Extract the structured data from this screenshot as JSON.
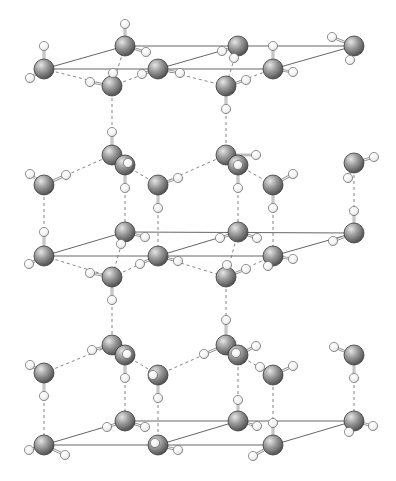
{
  "figure": {
    "caption_fragment": "... oxygen atoms ..."
  },
  "legend": {
    "oxygen_color": "#7a7a7a",
    "hydrogen_color": "#f4f4f4",
    "cell_line_color": "#555555",
    "hbond_line_color": "#777777"
  },
  "cells": [
    {
      "name": "top-cell",
      "pts": [
        [
          44,
          69
        ],
        [
          125,
          46
        ],
        [
          354,
          46
        ],
        [
          273,
          69
        ]
      ]
    },
    {
      "name": "middle-cell",
      "pts": [
        [
          44,
          256
        ],
        [
          125,
          232
        ],
        [
          354,
          233
        ],
        [
          273,
          256
        ]
      ]
    },
    {
      "name": "bottom-cell",
      "pts": [
        [
          44,
          445
        ],
        [
          125,
          421
        ],
        [
          354,
          421
        ],
        [
          273,
          445
        ]
      ]
    }
  ],
  "cell_edges": [
    [
      [
        44,
        69
      ],
      [
        158,
        69
      ]
    ],
    [
      [
        158,
        69
      ],
      [
        273,
        69
      ]
    ],
    [
      [
        125,
        46
      ],
      [
        238,
        46
      ]
    ],
    [
      [
        238,
        46
      ],
      [
        354,
        46
      ]
    ],
    [
      [
        44,
        69
      ],
      [
        125,
        46
      ]
    ],
    [
      [
        158,
        69
      ],
      [
        238,
        46
      ]
    ],
    [
      [
        273,
        69
      ],
      [
        354,
        46
      ]
    ],
    [
      [
        44,
        256
      ],
      [
        273,
        256
      ]
    ],
    [
      [
        125,
        232
      ],
      [
        354,
        233
      ]
    ],
    [
      [
        44,
        256
      ],
      [
        125,
        232
      ]
    ],
    [
      [
        158,
        256
      ],
      [
        238,
        232
      ]
    ],
    [
      [
        273,
        256
      ],
      [
        354,
        233
      ]
    ],
    [
      [
        44,
        445
      ],
      [
        273,
        445
      ]
    ],
    [
      [
        125,
        421
      ],
      [
        354,
        421
      ]
    ],
    [
      [
        44,
        445
      ],
      [
        125,
        421
      ]
    ],
    [
      [
        158,
        445
      ],
      [
        238,
        421
      ]
    ],
    [
      [
        273,
        445
      ],
      [
        354,
        421
      ]
    ]
  ],
  "hbonds": [
    [
      [
        44,
        69
      ],
      [
        112,
        86
      ]
    ],
    [
      [
        112,
        86
      ],
      [
        158,
        69
      ]
    ],
    [
      [
        158,
        69
      ],
      [
        226,
        86
      ]
    ],
    [
      [
        226,
        86
      ],
      [
        273,
        69
      ]
    ],
    [
      [
        125,
        46
      ],
      [
        112,
        86
      ]
    ],
    [
      [
        238,
        46
      ],
      [
        226,
        86
      ]
    ],
    [
      [
        112,
        86
      ],
      [
        112,
        155
      ]
    ],
    [
      [
        226,
        86
      ],
      [
        226,
        155
      ]
    ],
    [
      [
        44,
        185
      ],
      [
        112,
        155
      ]
    ],
    [
      [
        125,
        165
      ],
      [
        158,
        185
      ]
    ],
    [
      [
        158,
        185
      ],
      [
        226,
        155
      ]
    ],
    [
      [
        238,
        165
      ],
      [
        273,
        185
      ]
    ],
    [
      [
        44,
        185
      ],
      [
        44,
        256
      ]
    ],
    [
      [
        125,
        165
      ],
      [
        125,
        232
      ]
    ],
    [
      [
        158,
        185
      ],
      [
        158,
        256
      ]
    ],
    [
      [
        238,
        165
      ],
      [
        238,
        232
      ]
    ],
    [
      [
        273,
        185
      ],
      [
        273,
        256
      ]
    ],
    [
      [
        354,
        163
      ],
      [
        354,
        233
      ]
    ],
    [
      [
        44,
        256
      ],
      [
        112,
        277
      ]
    ],
    [
      [
        112,
        277
      ],
      [
        158,
        256
      ]
    ],
    [
      [
        158,
        256
      ],
      [
        226,
        277
      ]
    ],
    [
      [
        226,
        277
      ],
      [
        273,
        256
      ]
    ],
    [
      [
        125,
        232
      ],
      [
        112,
        277
      ]
    ],
    [
      [
        238,
        232
      ],
      [
        226,
        277
      ]
    ],
    [
      [
        112,
        277
      ],
      [
        112,
        345
      ]
    ],
    [
      [
        226,
        277
      ],
      [
        226,
        345
      ]
    ],
    [
      [
        44,
        373
      ],
      [
        112,
        345
      ]
    ],
    [
      [
        125,
        355
      ],
      [
        158,
        375
      ]
    ],
    [
      [
        158,
        375
      ],
      [
        226,
        345
      ]
    ],
    [
      [
        238,
        355
      ],
      [
        273,
        375
      ]
    ],
    [
      [
        44,
        373
      ],
      [
        44,
        445
      ]
    ],
    [
      [
        125,
        355
      ],
      [
        125,
        421
      ]
    ],
    [
      [
        158,
        375
      ],
      [
        158,
        445
      ]
    ],
    [
      [
        238,
        355
      ],
      [
        238,
        421
      ]
    ],
    [
      [
        273,
        375
      ],
      [
        273,
        445
      ]
    ],
    [
      [
        354,
        355
      ],
      [
        354,
        421
      ]
    ]
  ],
  "molecules": [
    {
      "o": [
        44,
        69
      ],
      "h": [
        [
          44,
          46
        ],
        [
          30,
          78
        ]
      ]
    },
    {
      "o": [
        125,
        46
      ],
      "h": [
        [
          125,
          24
        ],
        [
          146,
          52
        ]
      ]
    },
    {
      "o": [
        158,
        69
      ],
      "h": [
        [
          142,
          74
        ],
        [
          180,
          73
        ]
      ]
    },
    {
      "o": [
        112,
        86
      ],
      "h": [
        [
          90,
          82
        ],
        [
          113,
          73
        ]
      ]
    },
    {
      "o": [
        238,
        46
      ],
      "h": [
        [
          222,
          51
        ],
        [
          234,
          58
        ]
      ]
    },
    {
      "o": [
        273,
        69
      ],
      "h": [
        [
          273,
          46
        ],
        [
          293,
          72
        ]
      ]
    },
    {
      "o": [
        226,
        86
      ],
      "h": [
        [
          246,
          80
        ],
        [
          226,
          109
        ]
      ]
    },
    {
      "o": [
        354,
        46
      ],
      "h": [
        [
          332,
          37
        ],
        [
          350,
          60
        ]
      ]
    },
    {
      "o": [
        112,
        155
      ],
      "h": [
        [
          112,
          132
        ],
        [
          125,
          165
        ]
      ]
    },
    {
      "o": [
        125,
        165
      ],
      "h": [
        [
          128,
          163
        ],
        [
          125,
          188
        ]
      ]
    },
    {
      "o": [
        44,
        185
      ],
      "h": [
        [
          30,
          174
        ],
        [
          66,
          175
        ]
      ]
    },
    {
      "o": [
        158,
        185
      ],
      "h": [
        [
          178,
          178
        ],
        [
          158,
          208
        ]
      ]
    },
    {
      "o": [
        226,
        155
      ],
      "h": [
        [
          240,
          164
        ],
        [
          256,
          155
        ]
      ]
    },
    {
      "o": [
        238,
        165
      ],
      "h": [
        [
          238,
          188
        ],
        [
          238,
          165
        ]
      ]
    },
    {
      "o": [
        273,
        185
      ],
      "h": [
        [
          293,
          174
        ],
        [
          273,
          208
        ]
      ]
    },
    {
      "o": [
        354,
        163
      ],
      "h": [
        [
          374,
          157
        ],
        [
          348,
          178
        ]
      ]
    },
    {
      "o": [
        125,
        232
      ],
      "h": [
        [
          145,
          237
        ],
        [
          121,
          244
        ]
      ]
    },
    {
      "o": [
        238,
        232
      ],
      "h": [
        [
          220,
          238
        ],
        [
          257,
          238
        ]
      ]
    },
    {
      "o": [
        354,
        233
      ],
      "h": [
        [
          354,
          211
        ],
        [
          333,
          241
        ]
      ]
    },
    {
      "o": [
        44,
        256
      ],
      "h": [
        [
          44,
          232
        ],
        [
          29,
          264
        ]
      ]
    },
    {
      "o": [
        158,
        256
      ],
      "h": [
        [
          140,
          264
        ],
        [
          178,
          261
        ]
      ]
    },
    {
      "o": [
        273,
        256
      ],
      "h": [
        [
          293,
          259
        ],
        [
          268,
          266
        ]
      ]
    },
    {
      "o": [
        112,
        277
      ],
      "h": [
        [
          90,
          273
        ],
        [
          112,
          300
        ]
      ]
    },
    {
      "o": [
        226,
        277
      ],
      "h": [
        [
          246,
          269
        ],
        [
          227,
          265
        ]
      ]
    },
    {
      "o": [
        112,
        345
      ],
      "h": [
        [
          92,
          350
        ],
        [
          126,
          352
        ]
      ]
    },
    {
      "o": [
        125,
        355
      ],
      "h": [
        [
          125,
          378
        ],
        [
          127,
          354
        ]
      ]
    },
    {
      "o": [
        44,
        373
      ],
      "h": [
        [
          30,
          365
        ],
        [
          44,
          396
        ]
      ]
    },
    {
      "o": [
        158,
        375
      ],
      "h": [
        [
          153,
          375
        ],
        [
          158,
          398
        ]
      ]
    },
    {
      "o": [
        226,
        345
      ],
      "h": [
        [
          226,
          320
        ],
        [
          204,
          354
        ]
      ]
    },
    {
      "o": [
        238,
        355
      ],
      "h": [
        [
          256,
          346
        ],
        [
          236,
          353
        ]
      ]
    },
    {
      "o": [
        273,
        375
      ],
      "h": [
        [
          293,
          366
        ],
        [
          260,
          367
        ]
      ]
    },
    {
      "o": [
        354,
        355
      ],
      "h": [
        [
          334,
          347
        ],
        [
          354,
          378
        ]
      ]
    },
    {
      "o": [
        125,
        421
      ],
      "h": [
        [
          107,
          427
        ],
        [
          145,
          427
        ]
      ]
    },
    {
      "o": [
        238,
        421
      ],
      "h": [
        [
          238,
          400
        ],
        [
          257,
          426
        ]
      ]
    },
    {
      "o": [
        354,
        421
      ],
      "h": [
        [
          373,
          426
        ],
        [
          349,
          432
        ]
      ]
    },
    {
      "o": [
        44,
        445
      ],
      "h": [
        [
          29,
          450
        ],
        [
          65,
          455
        ]
      ]
    },
    {
      "o": [
        158,
        445
      ],
      "h": [
        [
          155,
          443
        ],
        [
          178,
          450
        ]
      ]
    },
    {
      "o": [
        273,
        445
      ],
      "h": [
        [
          273,
          423
        ],
        [
          253,
          456
        ]
      ]
    }
  ]
}
